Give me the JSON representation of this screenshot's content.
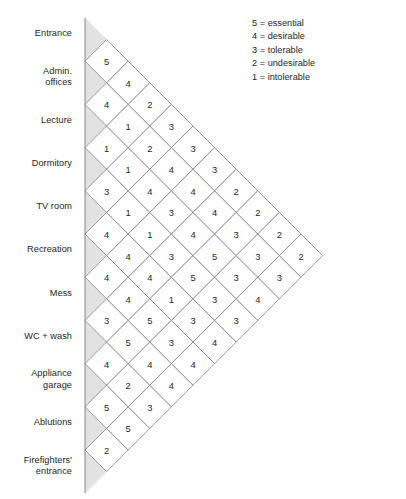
{
  "diagram": {
    "type": "relationship-matrix",
    "title": "",
    "scale_note": "Triangular adjacency / relationship matrix of spaces",
    "items": [
      "Entrance",
      "Admin. offices",
      "Lecture",
      "Dormitory",
      "TV room",
      "Recreation",
      "Mess",
      "WC + wash",
      "Appliance garage",
      "Ablutions",
      "Firefighters' entrance"
    ],
    "item_lines": [
      [
        "Entrance"
      ],
      [
        "Admin.",
        "offices"
      ],
      [
        "Lecture"
      ],
      [
        "Dormitory"
      ],
      [
        "TV room"
      ],
      [
        "Recreation"
      ],
      [
        "Mess"
      ],
      [
        "WC + wash"
      ],
      [
        "Appliance",
        "garage"
      ],
      [
        "Ablutions"
      ],
      [
        "Firefighters'",
        "entrance"
      ]
    ],
    "legend": {
      "entries": [
        {
          "value": "5",
          "eq": "=",
          "label": "essential"
        },
        {
          "value": "4",
          "eq": "=",
          "label": "desirable"
        },
        {
          "value": "3",
          "eq": "=",
          "label": "tolerable"
        },
        {
          "value": "2",
          "eq": "=",
          "label": "undesirable"
        },
        {
          "value": "1",
          "eq": "=",
          "label": "intolerable"
        }
      ]
    },
    "colors": {
      "line": "#6d6e71",
      "text": "#231f20",
      "edge_fill": "#e2e2e2",
      "cell_fill": "#ffffff",
      "background": "#ffffff"
    }
  },
  "chart_data": {
    "type": "heatmap",
    "xlabel": "",
    "ylabel": "",
    "categories": [
      "Entrance",
      "Admin. offices",
      "Lecture",
      "Dormitory",
      "TV room",
      "Recreation",
      "Mess",
      "WC + wash",
      "Appliance garage",
      "Ablutions",
      "Firefighters' entrance"
    ],
    "value_scale": {
      "5": "essential",
      "4": "desirable",
      "3": "tolerable",
      "2": "undesirable",
      "1": "intolerable"
    },
    "diagonal_columns": [
      {
        "offset": 1,
        "values": [
          5,
          4,
          1,
          3,
          4,
          4,
          3,
          4,
          5,
          2
        ]
      },
      {
        "offset": 2,
        "values": [
          4,
          1,
          1,
          1,
          4,
          4,
          5,
          2,
          5
        ]
      },
      {
        "offset": 3,
        "values": [
          2,
          2,
          4,
          1,
          4,
          5,
          4,
          3
        ]
      },
      {
        "offset": 4,
        "values": [
          3,
          4,
          3,
          3,
          1,
          3,
          4
        ]
      },
      {
        "offset": 5,
        "values": [
          3,
          4,
          4,
          5,
          3,
          4
        ]
      },
      {
        "offset": 6,
        "values": [
          3,
          4,
          5,
          3,
          4
        ]
      },
      {
        "offset": 7,
        "values": [
          2,
          3,
          3,
          3
        ]
      },
      {
        "offset": 8,
        "values": [
          2,
          3,
          4
        ]
      },
      {
        "offset": 9,
        "values": [
          2,
          3
        ]
      },
      {
        "offset": 10,
        "values": [
          2
        ]
      }
    ],
    "pairs": [
      {
        "a": "Entrance",
        "b": "Admin. offices",
        "v": 5
      },
      {
        "a": "Entrance",
        "b": "Lecture",
        "v": 4
      },
      {
        "a": "Entrance",
        "b": "Dormitory",
        "v": 2
      },
      {
        "a": "Entrance",
        "b": "TV room",
        "v": 3
      },
      {
        "a": "Entrance",
        "b": "Recreation",
        "v": 3
      },
      {
        "a": "Entrance",
        "b": "Mess",
        "v": 3
      },
      {
        "a": "Entrance",
        "b": "WC + wash",
        "v": 2
      },
      {
        "a": "Entrance",
        "b": "Appliance garage",
        "v": 2
      },
      {
        "a": "Entrance",
        "b": "Ablutions",
        "v": 2
      },
      {
        "a": "Entrance",
        "b": "Firefighters' entrance",
        "v": 2
      },
      {
        "a": "Admin. offices",
        "b": "Lecture",
        "v": 4
      },
      {
        "a": "Admin. offices",
        "b": "Dormitory",
        "v": 1
      },
      {
        "a": "Admin. offices",
        "b": "TV room",
        "v": 2
      },
      {
        "a": "Admin. offices",
        "b": "Recreation",
        "v": 4
      },
      {
        "a": "Admin. offices",
        "b": "Mess",
        "v": 4
      },
      {
        "a": "Admin. offices",
        "b": "WC + wash",
        "v": 4
      },
      {
        "a": "Admin. offices",
        "b": "Appliance garage",
        "v": 3
      },
      {
        "a": "Admin. offices",
        "b": "Ablutions",
        "v": 3
      },
      {
        "a": "Admin. offices",
        "b": "Firefighters' entrance",
        "v": 3
      },
      {
        "a": "Lecture",
        "b": "Dormitory",
        "v": 1
      },
      {
        "a": "Lecture",
        "b": "TV room",
        "v": 1
      },
      {
        "a": "Lecture",
        "b": "Recreation",
        "v": 4
      },
      {
        "a": "Lecture",
        "b": "Mess",
        "v": 3
      },
      {
        "a": "Lecture",
        "b": "WC + wash",
        "v": 4
      },
      {
        "a": "Lecture",
        "b": "Appliance garage",
        "v": 5
      },
      {
        "a": "Lecture",
        "b": "Ablutions",
        "v": 3
      },
      {
        "a": "Lecture",
        "b": "Firefighters' entrance",
        "v": 4
      },
      {
        "a": "Dormitory",
        "b": "TV room",
        "v": 3
      },
      {
        "a": "Dormitory",
        "b": "Recreation",
        "v": 1
      },
      {
        "a": "Dormitory",
        "b": "Mess",
        "v": 4
      },
      {
        "a": "Dormitory",
        "b": "WC + wash",
        "v": 3
      },
      {
        "a": "Dormitory",
        "b": "Appliance garage",
        "v": 4
      },
      {
        "a": "Dormitory",
        "b": "Ablutions",
        "v": 5
      },
      {
        "a": "Dormitory",
        "b": "Firefighters' entrance",
        "v": 3
      },
      {
        "a": "TV room",
        "b": "Recreation",
        "v": 4
      },
      {
        "a": "TV room",
        "b": "Mess",
        "v": 4
      },
      {
        "a": "TV room",
        "b": "WC + wash",
        "v": 4
      },
      {
        "a": "TV room",
        "b": "Appliance garage",
        "v": 3
      },
      {
        "a": "TV room",
        "b": "Ablutions",
        "v": 4
      },
      {
        "a": "Recreation",
        "b": "Mess",
        "v": 4
      },
      {
        "a": "Recreation",
        "b": "WC + wash",
        "v": 1
      },
      {
        "a": "Recreation",
        "b": "Appliance garage",
        "v": 5
      },
      {
        "a": "Recreation",
        "b": "Ablutions",
        "v": 5
      },
      {
        "a": "Mess",
        "b": "WC + wash",
        "v": 3
      },
      {
        "a": "Mess",
        "b": "Appliance garage",
        "v": 5
      },
      {
        "a": "Mess",
        "b": "Ablutions",
        "v": 3
      },
      {
        "a": "WC + wash",
        "b": "Appliance garage",
        "v": 4
      },
      {
        "a": "WC + wash",
        "b": "Ablutions",
        "v": 4
      },
      {
        "a": "Appliance garage",
        "b": "Ablutions",
        "v": 5
      },
      {
        "a": "Appliance garage",
        "b": "Firefighters' entrance",
        "v": 3
      },
      {
        "a": "Ablutions",
        "b": "Firefighters' entrance",
        "v": 2
      },
      {
        "a": "Mess",
        "b": "Firefighters' entrance",
        "v": 4
      },
      {
        "a": "WC + wash",
        "b": "Firefighters' entrance",
        "v": 3
      },
      {
        "a": "Recreation",
        "b": "Firefighters' entrance",
        "v": 4
      },
      {
        "a": "TV room",
        "b": "Firefighters' entrance",
        "v": 3
      }
    ]
  }
}
